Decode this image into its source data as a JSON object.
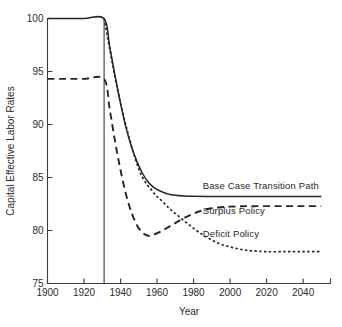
{
  "chart_data": {
    "type": "line",
    "title": "",
    "xlabel": "Year",
    "ylabel": "Capital Effective Labor Rates",
    "xlim": [
      1900,
      2055
    ],
    "ylim": [
      75,
      100
    ],
    "grid": false,
    "legend_position": "inline-right",
    "x_ticks": [
      1900,
      1920,
      1940,
      1960,
      1980,
      2000,
      2020,
      2040
    ],
    "x_tick_labels": [
      "1900",
      "1920",
      "1940",
      "1960",
      "1980",
      "2000",
      "2020",
      "2040"
    ],
    "y_ticks": [
      75,
      80,
      85,
      90,
      95,
      100
    ],
    "y_tick_labels": [
      "75",
      "80",
      "85",
      "90",
      "95",
      "100"
    ],
    "shock_year": 1931,
    "annotations": [
      {
        "name": "shock-vertical-line",
        "x": 1931,
        "y_from": 75,
        "y_to": 100
      }
    ],
    "series": [
      {
        "name": "Base Case Transition Path",
        "style": "solid",
        "label_x": 1985,
        "label_y": 83.9,
        "x": [
          1900,
          1910,
          1920,
          1931,
          1934,
          1937,
          1940,
          1943,
          1946,
          1949,
          1952,
          1955,
          1958,
          1962,
          1966,
          1970,
          1975,
          1980,
          1990,
          2000,
          2010,
          2020,
          2030,
          2040,
          2050
        ],
        "values": [
          100,
          100,
          100,
          100,
          97.4,
          94.6,
          92.0,
          89.7,
          87.9,
          86.5,
          85.4,
          84.6,
          84.1,
          83.7,
          83.45,
          83.32,
          83.25,
          83.22,
          83.2,
          83.2,
          83.2,
          83.2,
          83.2,
          83.2,
          83.2
        ]
      },
      {
        "name": "Surplus Policy",
        "style": "dashed",
        "label_x": 1985,
        "label_y": 81.6,
        "x": [
          1900,
          1910,
          1920,
          1931,
          1934,
          1937,
          1940,
          1943,
          1946,
          1949,
          1952,
          1955,
          1958,
          1962,
          1966,
          1970,
          1975,
          1980,
          1985,
          1990,
          1995,
          2000,
          2010,
          2020,
          2030,
          2040,
          2050
        ],
        "values": [
          94.3,
          94.3,
          94.3,
          94.3,
          91.5,
          88.4,
          85.7,
          83.4,
          81.7,
          80.5,
          79.8,
          79.5,
          79.6,
          79.9,
          80.3,
          80.7,
          81.2,
          81.6,
          81.9,
          82.1,
          82.2,
          82.25,
          82.3,
          82.3,
          82.3,
          82.3,
          82.3
        ]
      },
      {
        "name": "Deficit Policy",
        "style": "dotted",
        "label_x": 1985,
        "label_y": 79.4,
        "x": [
          1931,
          1940,
          1950,
          1958,
          1962,
          1966,
          1970,
          1975,
          1980,
          1985,
          1990,
          1995,
          2000,
          2005,
          2010,
          2015,
          2020,
          2030,
          2040,
          2050
        ],
        "values": [
          100,
          92.0,
          85.8,
          83.6,
          82.9,
          82.2,
          81.6,
          80.9,
          80.2,
          79.6,
          79.1,
          78.7,
          78.45,
          78.25,
          78.12,
          78.05,
          78.0,
          78.0,
          78.0,
          78.0
        ]
      }
    ]
  },
  "labels": {
    "base_case": "Base Case Transition Path",
    "surplus": "Surplus Policy",
    "deficit": "Deficit Policy",
    "x_axis_title": "Year",
    "y_axis_title": "Capital Effective Labor Rates"
  }
}
